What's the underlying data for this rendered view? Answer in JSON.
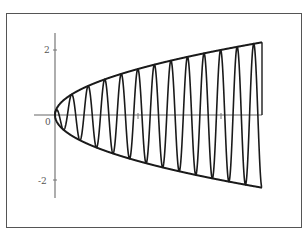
{
  "chart_data": {
    "type": "line",
    "title": "",
    "xlabel": "",
    "ylabel": "",
    "xlim": [
      -0.5,
      5
    ],
    "ylim": [
      -2.5,
      2.5
    ],
    "grid": false,
    "legend": null,
    "x_ticks": [
      {
        "value": 2,
        "label": ""
      },
      {
        "value": 4,
        "label": ""
      }
    ],
    "y_ticks": [
      {
        "value": 2,
        "label": "2"
      },
      {
        "value": 0,
        "label": "0"
      },
      {
        "value": -2,
        "label": "-2"
      }
    ],
    "series": [
      {
        "name": "oscillation",
        "function": "sqrt(x)*cos(5*pi*x)",
        "x_range": [
          0,
          5
        ],
        "color": "#1a1a1a"
      },
      {
        "name": "upper envelope",
        "function": "sqrt(x)",
        "x_range": [
          0,
          5
        ],
        "color": "#1a1a1a"
      },
      {
        "name": "lower envelope",
        "function": "-sqrt(x)",
        "x_range": [
          0,
          5
        ],
        "color": "#1a1a1a"
      }
    ],
    "annotations": [
      "vertical segment at x=5 from y=0 to envelope"
    ]
  },
  "labels": {
    "y_top": "2",
    "origin": "0",
    "y_bottom": "-2"
  }
}
